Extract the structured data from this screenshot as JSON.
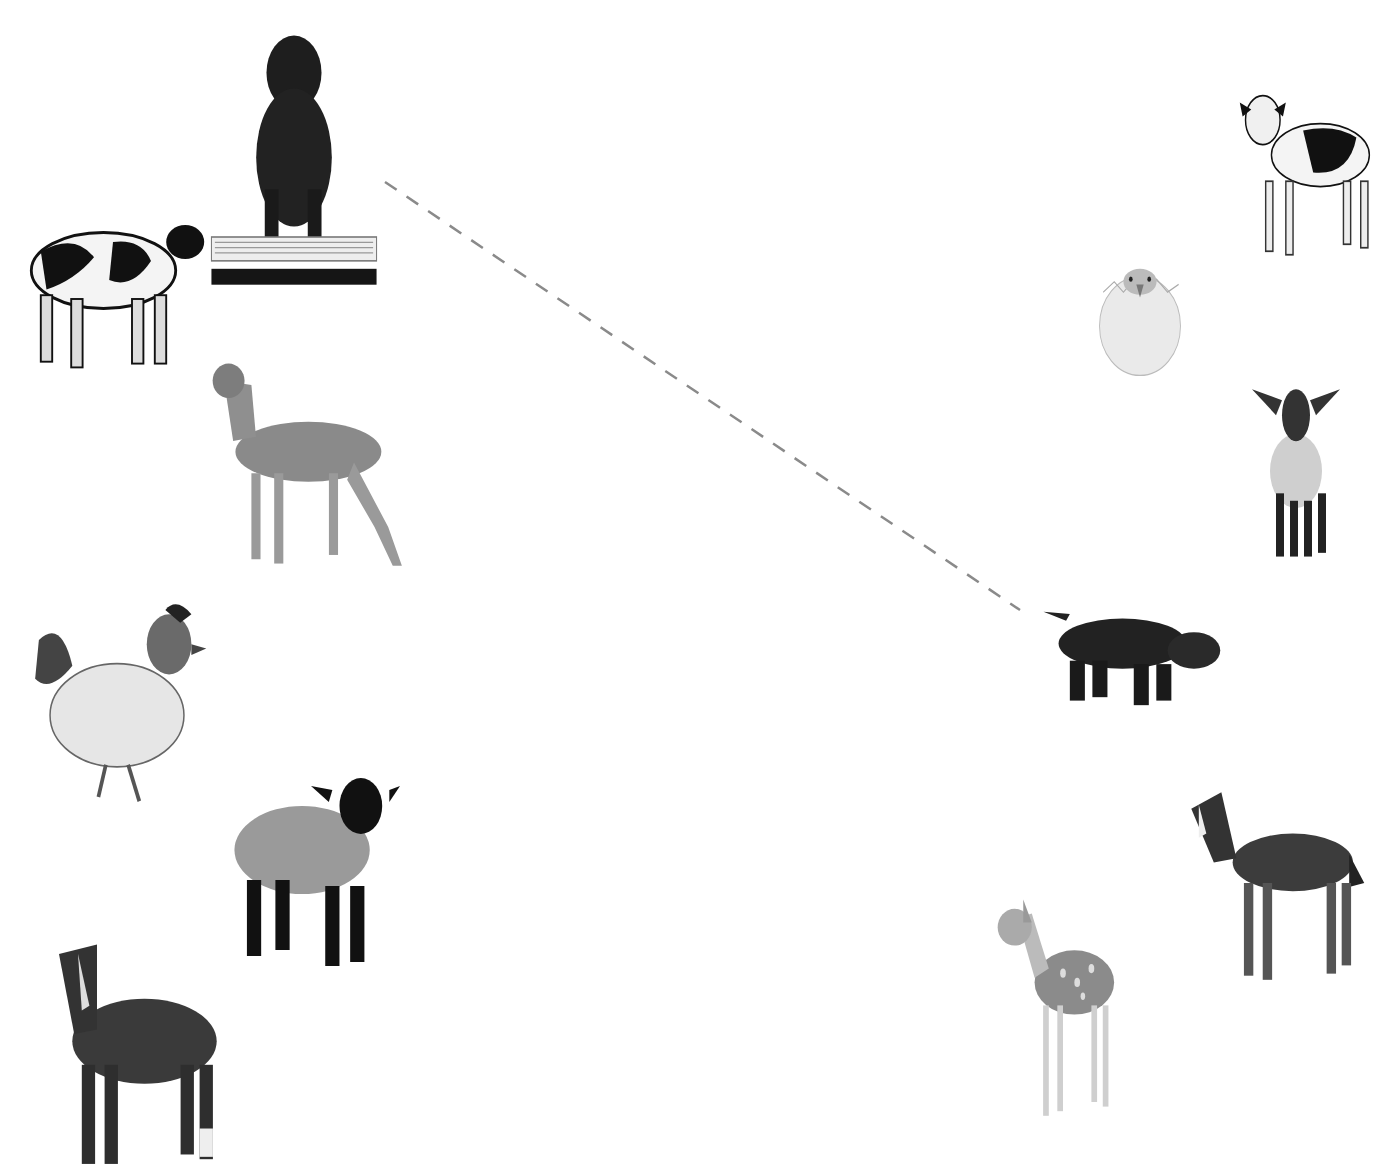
{
  "worksheet": {
    "instruction": "",
    "background": "#ffffff",
    "line_color": "#8a8a8a"
  },
  "adults": [
    {
      "id": "cow",
      "label": "cow",
      "box": [
        18,
        185,
        190,
        190
      ]
    },
    {
      "id": "dog",
      "label": "dog",
      "box": [
        208,
        25,
        172,
        265
      ]
    },
    {
      "id": "deer",
      "label": "deer",
      "box": [
        183,
        355,
        228,
        215
      ]
    },
    {
      "id": "chicken",
      "label": "chicken",
      "box": [
        24,
        597,
        186,
        215
      ]
    },
    {
      "id": "sheep",
      "label": "sheep",
      "box": [
        222,
        770,
        178,
        200
      ]
    },
    {
      "id": "horse",
      "label": "horse",
      "box": [
        40,
        935,
        190,
        236
      ]
    }
  ],
  "babies": [
    {
      "id": "calf",
      "label": "calf",
      "box": [
        1234,
        85,
        144,
        175
      ]
    },
    {
      "id": "chick",
      "label": "chick",
      "box": [
        1094,
        248,
        92,
        130
      ]
    },
    {
      "id": "lamb",
      "label": "lamb",
      "box": [
        1246,
        378,
        100,
        186
      ]
    },
    {
      "id": "puppy",
      "label": "puppy",
      "box": [
        1036,
        598,
        188,
        114
      ]
    },
    {
      "id": "foal",
      "label": "foal",
      "box": [
        1180,
        780,
        188,
        206
      ]
    },
    {
      "id": "fawn",
      "label": "fawn",
      "box": [
        992,
        895,
        142,
        230
      ]
    }
  ],
  "matches": [
    {
      "from": "dog",
      "to": "puppy",
      "x1": 385,
      "y1": 182,
      "x2": 1020,
      "y2": 610,
      "style": "dashed"
    }
  ]
}
